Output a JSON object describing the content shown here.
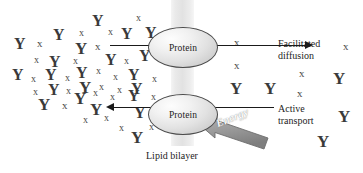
{
  "diagram": {
    "bilayer_caption": "Lipid bilayer",
    "protein_top_label": "Protein",
    "protein_bottom_label": "Protein",
    "facilitated_label": "Facilitated\ndiffusion",
    "facilitated_label_line1": "Facilitated",
    "facilitated_label_line2": "diffusion",
    "active_label_line1": "Active",
    "active_label_line2": "transport",
    "energy_label": "Energy",
    "colors": {
      "bilayer": "#e8e8e8",
      "protein_fill": "#e4e4e4",
      "protein_stroke": "#4a4a4a",
      "arrow": "#1a1a1a",
      "energy_arrow": "#9a9a9a",
      "molecule": "#3b3b3b",
      "background": "#ffffff"
    },
    "arrows": [
      {
        "name": "facilitated-diffusion-arrow",
        "direction": "right",
        "from_x": 110,
        "to_x": 312,
        "y": 45
      },
      {
        "name": "active-transport-arrow",
        "direction": "left",
        "from_x": 274,
        "to_x": 113,
        "y": 107
      },
      {
        "name": "energy-arrow",
        "direction": "up-left",
        "label": "Energy"
      }
    ],
    "molecules": {
      "y_symbol": "Y",
      "x_symbol": "x",
      "left_side": [
        {
          "t": "Y",
          "x": 14,
          "y": 36,
          "s": 16
        },
        {
          "t": "x",
          "x": 37,
          "y": 38,
          "s": 11
        },
        {
          "t": "Y",
          "x": 53,
          "y": 27,
          "s": 16
        },
        {
          "t": "x",
          "x": 79,
          "y": 28,
          "s": 10
        },
        {
          "t": "Y",
          "x": 92,
          "y": 13,
          "s": 16
        },
        {
          "t": "x",
          "x": 108,
          "y": 27,
          "s": 10
        },
        {
          "t": "x",
          "x": 136,
          "y": 13,
          "s": 10
        },
        {
          "t": "Y",
          "x": 121,
          "y": 26,
          "s": 16
        },
        {
          "t": "Y",
          "x": 145,
          "y": 25,
          "s": 16
        },
        {
          "t": "Y",
          "x": 75,
          "y": 40,
          "s": 17
        },
        {
          "t": "x",
          "x": 95,
          "y": 41,
          "s": 11
        },
        {
          "t": "x",
          "x": 34,
          "y": 55,
          "s": 10
        },
        {
          "t": "Y",
          "x": 49,
          "y": 54,
          "s": 16
        },
        {
          "t": "x",
          "x": 73,
          "y": 56,
          "s": 10
        },
        {
          "t": "Y",
          "x": 105,
          "y": 52,
          "s": 16
        },
        {
          "t": "x",
          "x": 124,
          "y": 56,
          "s": 10
        },
        {
          "t": "Y",
          "x": 139,
          "y": 48,
          "s": 16
        },
        {
          "t": "Y",
          "x": 12,
          "y": 67,
          "s": 16
        },
        {
          "t": "x",
          "x": 31,
          "y": 74,
          "s": 10
        },
        {
          "t": "Y",
          "x": 45,
          "y": 67,
          "s": 16
        },
        {
          "t": "x",
          "x": 65,
          "y": 73,
          "s": 10
        },
        {
          "t": "Y",
          "x": 76,
          "y": 65,
          "s": 16
        },
        {
          "t": "x",
          "x": 96,
          "y": 66,
          "s": 10
        },
        {
          "t": "x",
          "x": 113,
          "y": 72,
          "s": 10
        },
        {
          "t": "Y",
          "x": 128,
          "y": 67,
          "s": 16
        },
        {
          "t": "x",
          "x": 152,
          "y": 74,
          "s": 10
        },
        {
          "t": "x",
          "x": 33,
          "y": 87,
          "s": 10
        },
        {
          "t": "Y",
          "x": 48,
          "y": 82,
          "s": 16
        },
        {
          "t": "x",
          "x": 66,
          "y": 86,
          "s": 10
        },
        {
          "t": "Y",
          "x": 79,
          "y": 79,
          "s": 17
        },
        {
          "t": "x",
          "x": 99,
          "y": 82,
          "s": 10
        },
        {
          "t": "x",
          "x": 117,
          "y": 85,
          "s": 10
        },
        {
          "t": "Y",
          "x": 131,
          "y": 81,
          "s": 16
        },
        {
          "t": "Y",
          "x": 38,
          "y": 96,
          "s": 17
        },
        {
          "t": "x",
          "x": 62,
          "y": 100,
          "s": 11
        },
        {
          "t": "Y",
          "x": 74,
          "y": 90,
          "s": 17
        },
        {
          "t": "x",
          "x": 93,
          "y": 88,
          "s": 10
        },
        {
          "t": "x",
          "x": 110,
          "y": 92,
          "s": 10
        },
        {
          "t": "Y",
          "x": 128,
          "y": 88,
          "s": 16
        },
        {
          "t": "Y",
          "x": 90,
          "y": 101,
          "s": 17
        },
        {
          "t": "x",
          "x": 83,
          "y": 115,
          "s": 10
        },
        {
          "t": "x",
          "x": 104,
          "y": 113,
          "s": 10
        },
        {
          "t": "Y",
          "x": 134,
          "y": 105,
          "s": 16
        },
        {
          "t": "x",
          "x": 119,
          "y": 123,
          "s": 10
        },
        {
          "t": "x",
          "x": 149,
          "y": 122,
          "s": 10
        },
        {
          "t": "Y",
          "x": 131,
          "y": 129,
          "s": 17
        },
        {
          "t": "x",
          "x": 151,
          "y": 92,
          "s": 10
        }
      ],
      "right_side": [
        {
          "t": "x",
          "x": 234,
          "y": 37,
          "s": 11
        },
        {
          "t": "x",
          "x": 234,
          "y": 60,
          "s": 11
        },
        {
          "t": "x",
          "x": 343,
          "y": 41,
          "s": 11
        },
        {
          "t": "Y",
          "x": 230,
          "y": 80,
          "s": 17
        },
        {
          "t": "Y",
          "x": 264,
          "y": 80,
          "s": 17
        },
        {
          "t": "x",
          "x": 299,
          "y": 68,
          "s": 11
        },
        {
          "t": "x",
          "x": 297,
          "y": 88,
          "s": 11
        },
        {
          "t": "Y",
          "x": 333,
          "y": 70,
          "s": 17
        },
        {
          "t": "Y",
          "x": 338,
          "y": 108,
          "s": 17
        },
        {
          "t": "Y",
          "x": 317,
          "y": 133,
          "s": 17
        }
      ]
    }
  }
}
